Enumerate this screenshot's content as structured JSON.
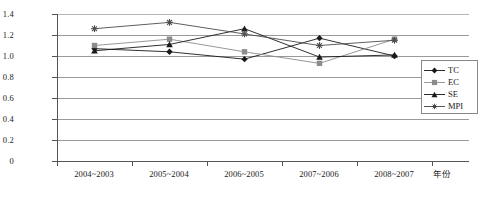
{
  "chart_data": {
    "type": "line",
    "title": "",
    "xlabel": "年份",
    "ylabel": "",
    "categories": [
      "2004~2003",
      "2005~2004",
      "2006~2005",
      "2007~2006",
      "2008~2007"
    ],
    "series": [
      {
        "name": "TC",
        "marker": "diamond",
        "color": "#1a1a1a",
        "values": [
          1.07,
          1.04,
          0.97,
          1.17,
          1.0
        ]
      },
      {
        "name": "EC",
        "marker": "square",
        "color": "#8c8c8c",
        "values": [
          1.1,
          1.16,
          1.04,
          0.93,
          1.16
        ]
      },
      {
        "name": "SE",
        "marker": "triangle",
        "color": "#1a1a1a",
        "values": [
          1.05,
          1.11,
          1.26,
          0.99,
          1.01
        ]
      },
      {
        "name": "MPI",
        "marker": "asterisk",
        "color": "#4d4d4d",
        "values": [
          1.26,
          1.32,
          1.21,
          1.1,
          1.15
        ]
      }
    ],
    "ylim": [
      0,
      1.4
    ],
    "yticks": [
      "1.4",
      "1.2",
      "1.0",
      "0.8",
      "0.6",
      "0.4",
      "0.2",
      "0"
    ],
    "grid": true,
    "legend_position": "right"
  },
  "legend": {
    "items": [
      {
        "label": "TC"
      },
      {
        "label": "EC"
      },
      {
        "label": "SE"
      },
      {
        "label": "MPI"
      }
    ]
  }
}
